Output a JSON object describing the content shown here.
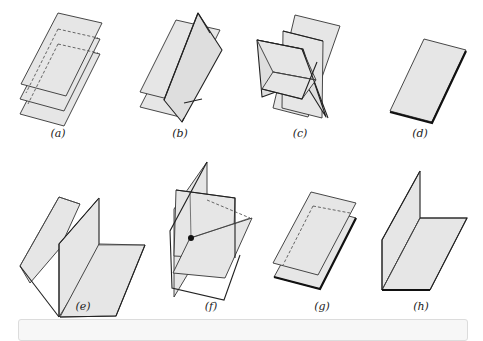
{
  "figure": {
    "panels": [
      {
        "id": "a",
        "label": "(a)",
        "description": "Three parallel planes"
      },
      {
        "id": "b",
        "label": "(b)",
        "description": "Two parallel planes intersected by a third plane"
      },
      {
        "id": "c",
        "label": "(c)",
        "description": "Three planes intersecting in a common line"
      },
      {
        "id": "d",
        "label": "(d)",
        "description": "Three coincident planes"
      },
      {
        "id": "e",
        "label": "(e)",
        "description": "Three planes intersecting pairwise in parallel lines? / two planes meeting one plane along lines"
      },
      {
        "id": "f",
        "label": "(f)",
        "description": "Three planes intersecting at a single point"
      },
      {
        "id": "g",
        "label": "(g)",
        "description": "Two coincident planes parallel to a third"
      },
      {
        "id": "h",
        "label": "(h)",
        "description": "Two coincident planes intersecting a third"
      }
    ]
  },
  "colors": {
    "plane_fill": "#e6e6e6",
    "edge": "#222222",
    "background": "#ffffff"
  }
}
